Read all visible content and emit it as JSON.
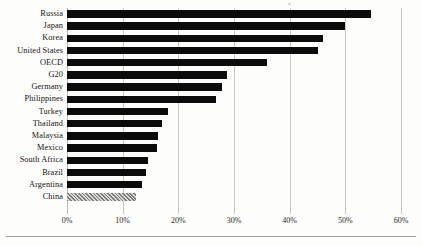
{
  "chart_data": {
    "type": "bar",
    "orientation": "horizontal",
    "title": "",
    "subtitle": "",
    "xlabel": "",
    "ylabel": "",
    "xlim": [
      0,
      60
    ],
    "x_tick_labels": [
      "0%",
      "10%",
      "20%",
      "30%",
      "40%",
      "50%",
      "60%"
    ],
    "x_ticks": [
      0,
      10,
      20,
      30,
      40,
      50,
      60
    ],
    "grid": "vertical",
    "legend": "none",
    "value_unit": "%",
    "categories": [
      "Russia",
      "Japan",
      "Korea",
      "United States",
      "OECD",
      "G20",
      "Germany",
      "Philippines",
      "Turkey",
      "Thailand",
      "Malaysia",
      "Mexico",
      "South Africa",
      "Brazil",
      "Argentina",
      "China"
    ],
    "values": [
      54.6,
      49.9,
      46.0,
      45.0,
      36.0,
      28.8,
      27.8,
      26.8,
      18.2,
      17.0,
      16.4,
      16.1,
      14.6,
      14.2,
      13.4,
      12.4
    ],
    "bar_styles": [
      "solid",
      "solid",
      "solid",
      "solid",
      "solid",
      "solid",
      "solid",
      "solid",
      "solid",
      "solid",
      "solid",
      "solid",
      "solid",
      "solid",
      "solid",
      "hatched"
    ],
    "highlight_category": "China",
    "colors": {
      "bar": "#0b0b0b",
      "bar_highlight": "#9a9a97",
      "gridline": "#c9c9c4",
      "background": "#fdfdfb",
      "text": "#141414"
    }
  }
}
